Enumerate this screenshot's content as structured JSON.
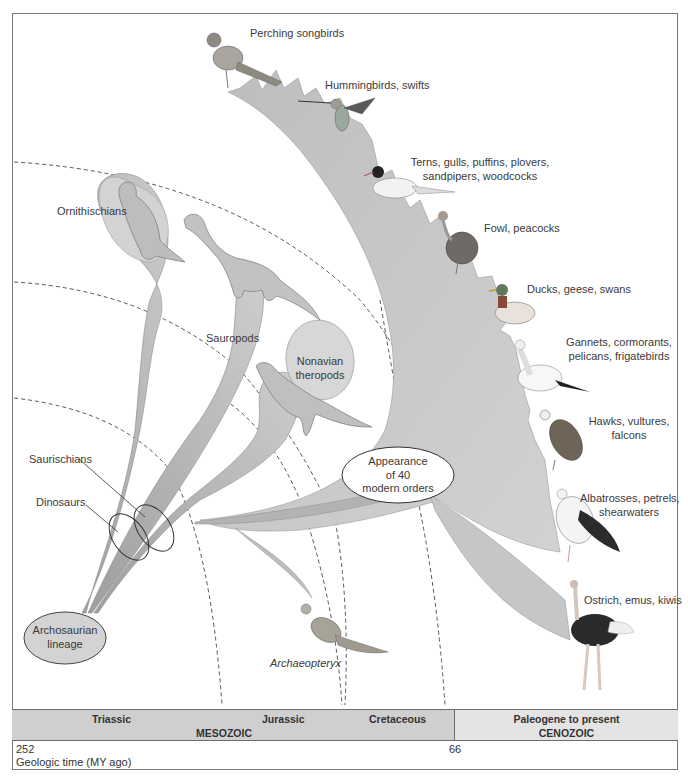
{
  "diagram": {
    "clades": {
      "ornithischians": "Ornithischians",
      "sauropods": "Sauropods",
      "nonavian_theropods_line1": "Nonavian",
      "nonavian_theropods_line2": "theropods",
      "saurischians": "Saurischians",
      "dinosaurs": "Dinosaurs",
      "archosaurian_line1": "Archosaurian",
      "archosaurian_line2": "lineage",
      "archaeopteryx": "Archaeopteryx",
      "modern_orders_line1": "Appearance",
      "modern_orders_line2": "of 40",
      "modern_orders_line3": "modern orders"
    },
    "bird_groups": [
      {
        "line1": "Perching songbirds",
        "line2": ""
      },
      {
        "line1": "Hummingbirds, swifts",
        "line2": ""
      },
      {
        "line1": "Terns, gulls, puffins, plovers,",
        "line2": "sandpipers, woodcocks"
      },
      {
        "line1": "Fowl, peacocks",
        "line2": ""
      },
      {
        "line1": "Ducks, geese, swans",
        "line2": ""
      },
      {
        "line1": "Gannets, cormorants,",
        "line2": "pelicans, frigatebirds"
      },
      {
        "line1": "Hawks, vultures,",
        "line2": "falcons"
      },
      {
        "line1": "Albatrosses, petrels,",
        "line2": "shearwaters"
      },
      {
        "line1": "Ostrich, emus, kiwis",
        "line2": ""
      }
    ],
    "colors": {
      "branch_fill": "#c4c4c4",
      "branch_dark": "#a9a9a9",
      "bubble_fill": "#d7d7d7",
      "mesozoic_bar": "#cfcfcf",
      "cenozoic_bar": "#e4e4e4"
    }
  },
  "timeline": {
    "periods": {
      "triassic": "Triassic",
      "jurassic": "Jurassic",
      "cretaceous": "Cretaceous",
      "paleogene": "Paleogene to present"
    },
    "eras": {
      "mesozoic": "MESOZOIC",
      "cenozoic": "CENOZOIC"
    },
    "start_value": "252",
    "boundary_value": "66",
    "axis_label": "Geologic time (MY ago)"
  }
}
